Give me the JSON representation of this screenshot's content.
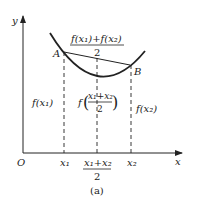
{
  "axes": {
    "x_label": "x",
    "y_label": "y",
    "origin_label": "O"
  },
  "points": {
    "A": "A",
    "B": "B"
  },
  "labels": {
    "fx1": "f(x₁)",
    "fx2": "f(x₂)",
    "chord_mid_num": "f(x₁)+f(x₂)",
    "chord_mid_den": "2",
    "f_mid_prefix": "f",
    "f_mid_num": "x₁+x₂",
    "f_mid_den": "2",
    "x1": "x₁",
    "x2": "x₂",
    "xmid_num": "x₁+x₂",
    "xmid_den": "2"
  },
  "caption": "(a)",
  "colors": {
    "stroke": "#222222",
    "background": "#ffffff"
  }
}
